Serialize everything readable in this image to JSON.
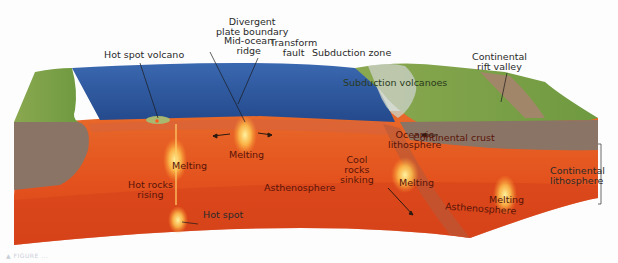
{
  "figure": {
    "caption": "▲ FIGURE ..."
  },
  "colors": {
    "ocean": "#2f5aa0",
    "land_green": "#7fa24a",
    "crust_brown": "#8a7466",
    "asthenosphere": "#e4531e",
    "mantle_dark": "#c8421a",
    "melting_glow": "#ffe070",
    "label_text": "#2a2a2a",
    "label_deep": "#5a1408"
  },
  "labels": {
    "divergent_boundary": "Divergent\nplate boundary",
    "mid_ocean_ridge": "Mid-ocean\nridge",
    "transform_fault": "Transform\nfault",
    "hot_spot_volcano": "Hot spot volcano",
    "subduction_zone": "Subduction zone",
    "subduction_volcanoes": "Subduction volcanoes",
    "continental_rift_valley": "Continental\nrift valley",
    "oceanic_lithosphere": "Oceanic\nlithosphere",
    "continental_crust": "Continental crust",
    "continental_lithosphere": "Continental\nlithosphere",
    "melting_1": "Melting",
    "melting_2": "Melting",
    "melting_3": "Melting",
    "melting_4": "Melting",
    "hot_rocks_rising": "Hot rocks\nrising",
    "asthenosphere_1": "Asthenosphere",
    "asthenosphere_2": "Asthenosphere",
    "cool_rocks_sinking": "Cool\nrocks\nsinking",
    "hot_spot": "Hot spot"
  }
}
